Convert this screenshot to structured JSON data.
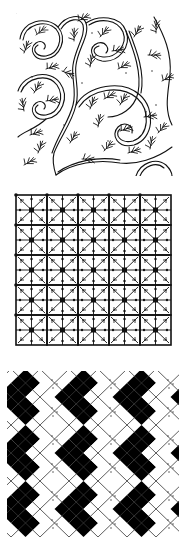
{
  "panels": [
    {
      "id": "swirl-foliage",
      "description": "Scrolling double-line vines with fern-like leaf sprigs",
      "stroke_color": "#111111",
      "background": "#ffffff"
    },
    {
      "id": "grid-lattice",
      "description": "Square lattice with diagonal crosses and filled center squares",
      "rows": 5,
      "cols": 5,
      "stroke_color": "#111111",
      "background": "#ffffff"
    },
    {
      "id": "harlequin-diamonds",
      "description": "Argyle pattern of alternating black and dotted white diamonds with crossing lines",
      "fill_color": "#000000",
      "line_color": "#333333",
      "background": "#ffffff"
    }
  ]
}
